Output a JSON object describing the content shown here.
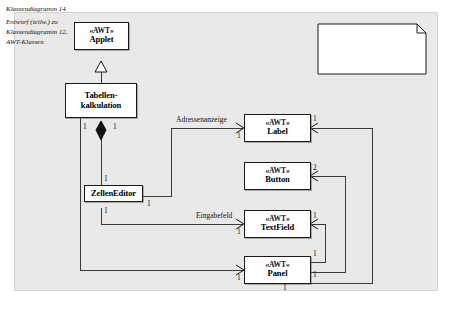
{
  "diagram": {
    "type": "uml-class-diagram",
    "title": "Klassendiagramm 14",
    "canvas_color": "#e9e9e9",
    "box_fill": "#ffffff",
    "line_color": "#1a1a1a"
  },
  "note": {
    "name": "diagram-note",
    "lines": [
      "Klassendiagramm 14",
      "Entwurf (teilw.) zu",
      "Klassendiagramm 12,",
      "AWT-Klassen"
    ]
  },
  "classes": [
    {
      "id": "applet",
      "stereotype": "«AWT»",
      "name": "Applet",
      "name2": ""
    },
    {
      "id": "tabellenkalkulation",
      "stereotype": "",
      "name": "Tabellen-",
      "name2": "kalkulation"
    },
    {
      "id": "zelleneditor",
      "stereotype": "",
      "name": "ZellenEditor",
      "name2": ""
    },
    {
      "id": "label",
      "stereotype": "«AWT»",
      "name": "Label",
      "name2": ""
    },
    {
      "id": "button",
      "stereotype": "«AWT»",
      "name": "Button",
      "name2": ""
    },
    {
      "id": "textfield",
      "stereotype": "«AWT»",
      "name": "TextField",
      "name2": ""
    },
    {
      "id": "panel",
      "stereotype": "«AWT»",
      "name": "Panel",
      "name2": ""
    }
  ],
  "role_labels": {
    "adressenanzeige": "Adressenanzeige",
    "eingabefeld": "Eingabefeld"
  },
  "multiplicities": {
    "tk_left": "1",
    "tk_right": "1",
    "ze_top": "1",
    "ze_right": "1",
    "ze_bottom": "1",
    "label_in": "1",
    "label_right": "1",
    "button_right": "2",
    "textfield_in": "1",
    "textfield_right": "1",
    "panel_in": "1",
    "panel_r_top": "1",
    "panel_r_mid": "1",
    "panel_r_bot": "1"
  },
  "relations": [
    {
      "from": "tabellenkalkulation",
      "to": "applet",
      "kind": "generalization"
    },
    {
      "from": "tabellenkalkulation",
      "to": "zelleneditor",
      "kind": "composition"
    },
    {
      "from": "zelleneditor",
      "to": "label",
      "kind": "association",
      "role": "Adressenanzeige"
    },
    {
      "from": "zelleneditor",
      "to": "textfield",
      "kind": "association",
      "role": "Eingabefeld"
    },
    {
      "from": "tabellenkalkulation",
      "to": "panel",
      "kind": "association"
    },
    {
      "from": "panel",
      "to": "label",
      "kind": "association"
    },
    {
      "from": "panel",
      "to": "button",
      "kind": "association"
    },
    {
      "from": "panel",
      "to": "textfield",
      "kind": "association"
    }
  ]
}
